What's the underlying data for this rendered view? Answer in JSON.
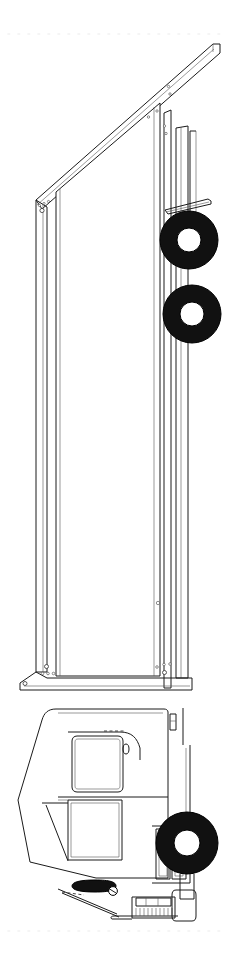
{
  "figure": {
    "kind": "technical-line-drawing",
    "orientation": "rotated-90-vertical",
    "background_color": "#ffffff",
    "line_color": "#1a1a1a",
    "tire_color": "#111111",
    "guide_color": "#f2f2f2",
    "canvas": {
      "width": 232,
      "height": 966
    }
  },
  "guides": {
    "top_dotted_rule": {
      "y": 34,
      "x_start": 8,
      "x_end": 226
    },
    "bottom_dotted_rule": {
      "y": 931,
      "x_start": 8,
      "x_end": 226
    }
  },
  "parts": {
    "trailer": {
      "label": "trailer-box",
      "roof_rail": "angled-top-rail",
      "side_panel": "long-flat-side",
      "rear_corner_posts": 3,
      "bolt_clusters": 4
    },
    "trailer_wheels": [
      {
        "label": "trailer-wheel-rear",
        "cx": 189,
        "cy": 240,
        "r_outer": 29,
        "r_inner": 12
      },
      {
        "label": "trailer-wheel-front",
        "cx": 192,
        "cy": 314,
        "r_outer": 29,
        "r_inner": 12
      }
    ],
    "mudflap_bracket": {
      "label": "mudflap-bracket",
      "x": 186,
      "y": 203
    },
    "tractor": {
      "label": "tractor-cab",
      "windshield": "cab-window-upper",
      "door_window": "cab-window-lower",
      "door_handle": "door-handle",
      "exhaust_stack": "exhaust-stack",
      "grille_panels": 2,
      "fuel_tank": "fuel-tank",
      "front_bumper": "front-bumper-grille",
      "air_cleaner": "air-cleaner-canister"
    },
    "tractor_wheel": {
      "label": "tractor-front-wheel",
      "cx": 187,
      "cy": 843,
      "r_outer": 31,
      "r_inner": 13
    }
  },
  "annotations": {
    "title": "",
    "caption": "",
    "visible_text": []
  }
}
